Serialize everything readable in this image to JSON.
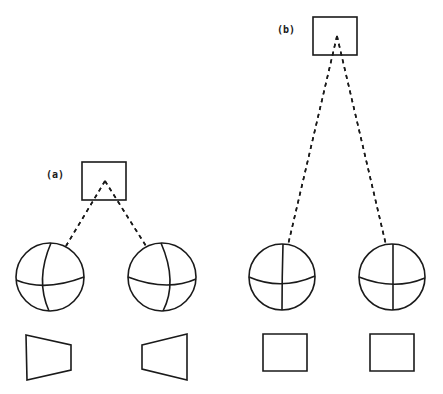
{
  "diagram": {
    "colors": {
      "ink": "#1a1a1a",
      "background": "#ffffff"
    },
    "groups": [
      {
        "label": "(a)",
        "label_pos": [
          46,
          169
        ],
        "source_box": {
          "x": 82,
          "y": 162,
          "w": 44,
          "h": 38
        },
        "apex": [
          105,
          181
        ],
        "spheres": [
          {
            "cx": 50,
            "cy": 277,
            "r": 34,
            "meridian": "M51,243 Q35,280 49,311",
            "equator": "M16,280 Q45,292 84,277"
          },
          {
            "cx": 162,
            "cy": 277,
            "r": 34,
            "meridian": "M161,243 Q178,282 163,311",
            "equator": "M128,277 Q167,292 196,279"
          }
        ],
        "dashed_targets": [
          [
            66,
            246
          ],
          [
            146,
            246
          ]
        ],
        "projections": [
          {
            "shape": "trapezoid",
            "points": "26,335 71,345 71,370 27,380"
          },
          {
            "shape": "trapezoid",
            "points": "142,345 187,334 187,380 142,369"
          }
        ]
      },
      {
        "label": "(b)",
        "label_pos": [
          277,
          24
        ],
        "source_box": {
          "x": 313,
          "y": 17,
          "w": 44,
          "h": 38
        },
        "apex": [
          337,
          36
        ],
        "spheres": [
          {
            "cx": 282,
            "cy": 277,
            "r": 33,
            "meridian": "M283,244 Q282,277 282,310",
            "equator": "M249,277 Q281,291 315,276"
          },
          {
            "cx": 392,
            "cy": 277,
            "r": 33,
            "meridian": "M393,244 Q393,277 393,310",
            "equator": "M359,277 Q394,291 425,278"
          }
        ],
        "dashed_targets": [
          [
            288,
            245
          ],
          [
            386,
            245
          ]
        ],
        "projections": [
          {
            "shape": "rectangle",
            "points": "263,334 307,334 307,371 263,371"
          },
          {
            "shape": "rectangle",
            "points": "370,334 414,334 414,371 370,371"
          }
        ]
      }
    ]
  }
}
